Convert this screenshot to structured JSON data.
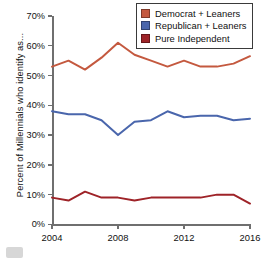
{
  "chart_data": {
    "type": "line",
    "title": "",
    "xlabel": "",
    "ylabel": "Percent of Millennials who identify as...",
    "xlim": [
      2004,
      2016
    ],
    "ylim": [
      0,
      70
    ],
    "grid": false,
    "legend_position": "top-right",
    "x": [
      2004,
      2005,
      2006,
      2007,
      2008,
      2009,
      2010,
      2011,
      2012,
      2013,
      2014,
      2015,
      2016
    ],
    "xticks": [
      "2004",
      "2008",
      "2012",
      "2016"
    ],
    "xtick_values": [
      2004,
      2008,
      2012,
      2016
    ],
    "yticks": [
      "0%",
      "10%",
      "20%",
      "30%",
      "40%",
      "50%",
      "60%",
      "70%"
    ],
    "ytick_values": [
      0,
      10,
      20,
      30,
      40,
      50,
      60,
      70
    ],
    "series": [
      {
        "name": "Democrat + Leaners",
        "color": "#c4593f",
        "values": [
          53,
          55,
          52,
          56,
          61,
          57,
          55,
          53,
          55,
          53,
          53,
          54,
          56.5
        ]
      },
      {
        "name": "Republican + Leaners",
        "color": "#4a66ac",
        "values": [
          38,
          37,
          37,
          35,
          30,
          34.5,
          35,
          38,
          36,
          36.5,
          36.5,
          35,
          35.5
        ]
      },
      {
        "name": "Pure Independent",
        "color": "#9e2328",
        "values": [
          9,
          8,
          11,
          9,
          9,
          8,
          9,
          9,
          9,
          9,
          10,
          10,
          7
        ]
      }
    ]
  },
  "legend": {
    "items": [
      {
        "label": "Democrat + Leaners",
        "color": "#c4593f"
      },
      {
        "label": "Republican + Leaners",
        "color": "#4a66ac"
      },
      {
        "label": "Pure Independent",
        "color": "#9e2328"
      }
    ]
  },
  "axes": {
    "y_title": "Percent of Millennials who identify as..."
  }
}
